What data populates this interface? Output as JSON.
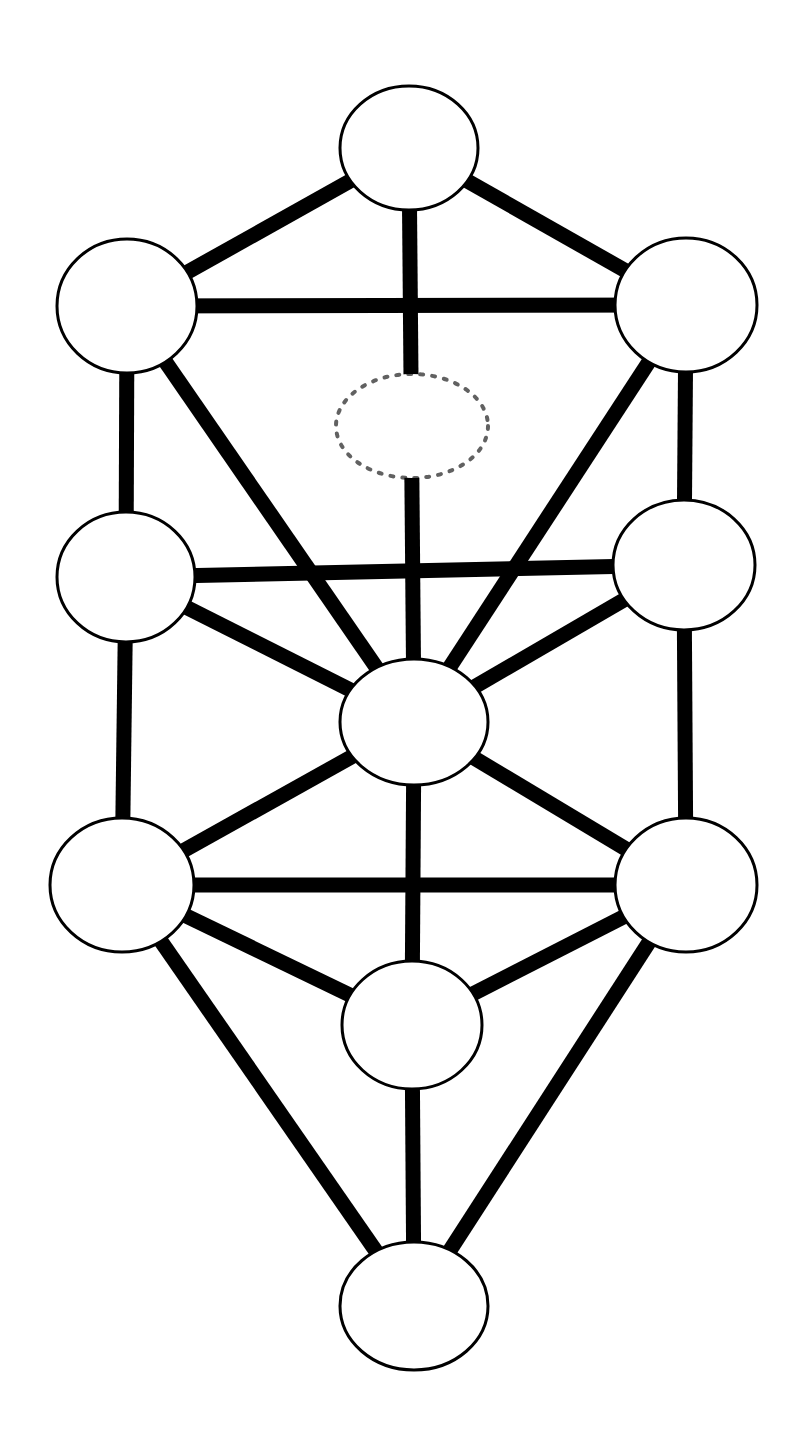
{
  "figure": {
    "name": "tree-of-life-sephirot-diagram",
    "background_color": "#ffffff",
    "stroke_color": "#000000",
    "node_fill_color": "#ffffff",
    "width": 810,
    "height": 1454,
    "edge_stroke_width": 15,
    "node_stroke_width": 3,
    "dashed_stroke_width": 4,
    "dash_pattern": "3 9"
  },
  "chart_data": {
    "type": "diagram-graph",
    "title": "",
    "nodes": [
      {
        "id": "keter",
        "label": "",
        "cx": 409,
        "cy": 148,
        "rx": 69,
        "ry": 62,
        "style": "solid"
      },
      {
        "id": "binah",
        "label": "",
        "cx": 127,
        "cy": 306,
        "rx": 70,
        "ry": 67,
        "style": "solid"
      },
      {
        "id": "chokhmah",
        "label": "",
        "cx": 686,
        "cy": 305,
        "rx": 71,
        "ry": 67,
        "style": "solid"
      },
      {
        "id": "daat",
        "label": "",
        "cx": 412,
        "cy": 426,
        "rx": 76,
        "ry": 52,
        "style": "dotted"
      },
      {
        "id": "gevurah",
        "label": "",
        "cx": 126,
        "cy": 577,
        "rx": 69,
        "ry": 65,
        "style": "solid"
      },
      {
        "id": "chesed",
        "label": "",
        "cx": 684,
        "cy": 565,
        "rx": 71,
        "ry": 65,
        "style": "solid"
      },
      {
        "id": "tiferet",
        "label": "",
        "cx": 414,
        "cy": 722,
        "rx": 74,
        "ry": 63,
        "style": "solid"
      },
      {
        "id": "hod",
        "label": "",
        "cx": 122,
        "cy": 885,
        "rx": 72,
        "ry": 67,
        "style": "solid"
      },
      {
        "id": "netzach",
        "label": "",
        "cx": 686,
        "cy": 885,
        "rx": 71,
        "ry": 67,
        "style": "solid"
      },
      {
        "id": "yesod",
        "label": "",
        "cx": 412,
        "cy": 1025,
        "rx": 70,
        "ry": 64,
        "style": "solid"
      },
      {
        "id": "malkuth",
        "label": "",
        "cx": 414,
        "cy": 1306,
        "rx": 74,
        "ry": 64,
        "style": "solid"
      }
    ],
    "edges": [
      {
        "from": "keter",
        "to": "binah"
      },
      {
        "from": "keter",
        "to": "chokhmah"
      },
      {
        "from": "keter",
        "to": "tiferet"
      },
      {
        "from": "binah",
        "to": "chokhmah"
      },
      {
        "from": "binah",
        "to": "gevurah"
      },
      {
        "from": "binah",
        "to": "tiferet"
      },
      {
        "from": "chokhmah",
        "to": "chesed"
      },
      {
        "from": "chokhmah",
        "to": "tiferet"
      },
      {
        "from": "gevurah",
        "to": "chesed"
      },
      {
        "from": "gevurah",
        "to": "hod"
      },
      {
        "from": "gevurah",
        "to": "tiferet"
      },
      {
        "from": "chesed",
        "to": "netzach"
      },
      {
        "from": "chesed",
        "to": "tiferet"
      },
      {
        "from": "tiferet",
        "to": "hod"
      },
      {
        "from": "tiferet",
        "to": "netzach"
      },
      {
        "from": "tiferet",
        "to": "yesod"
      },
      {
        "from": "hod",
        "to": "netzach"
      },
      {
        "from": "hod",
        "to": "yesod"
      },
      {
        "from": "hod",
        "to": "malkuth"
      },
      {
        "from": "netzach",
        "to": "yesod"
      },
      {
        "from": "netzach",
        "to": "malkuth"
      },
      {
        "from": "yesod",
        "to": "malkuth"
      }
    ],
    "node_count": 11,
    "solid_node_count": 10,
    "dotted_node_count": 1,
    "edge_count": 22,
    "legend": [],
    "annotations": []
  }
}
